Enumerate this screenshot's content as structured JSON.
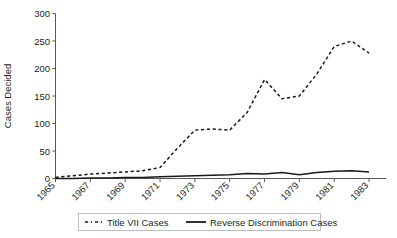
{
  "chart_data": {
    "type": "line",
    "title": "",
    "xlabel": "",
    "ylabel": "Cases Decided",
    "ylim": [
      0,
      300
    ],
    "ytick_values": [
      0,
      50,
      100,
      150,
      200,
      250,
      300
    ],
    "ytick_labels": [
      "0",
      "50",
      "100",
      "150",
      "200",
      "250",
      "300"
    ],
    "xlim": [
      1965,
      1984
    ],
    "xtick_labels": [
      "1965",
      "1967",
      "1969",
      "1971",
      "1973",
      "1975",
      "1977",
      "1979",
      "1981",
      "1983"
    ],
    "xtick_values": [
      1965,
      1967,
      1969,
      1971,
      1973,
      1975,
      1977,
      1979,
      1981,
      1983
    ],
    "x": [
      1965,
      1966,
      1967,
      1968,
      1969,
      1970,
      1971,
      1972,
      1973,
      1974,
      1975,
      1976,
      1977,
      1978,
      1979,
      1980,
      1981,
      1982,
      1983
    ],
    "grid": false,
    "legend_position": "bottom",
    "series": [
      {
        "name": "Title VII Cases",
        "style": "dashed",
        "color": "#1a1a1a",
        "values": [
          2,
          5,
          8,
          10,
          12,
          14,
          20,
          55,
          88,
          90,
          88,
          120,
          180,
          145,
          150,
          190,
          240,
          250,
          228
        ]
      },
      {
        "name": "Reverse Discrimination Cases",
        "style": "solid",
        "color": "#1a1a1a",
        "values": [
          0,
          0,
          1,
          1,
          2,
          2,
          3,
          4,
          5,
          6,
          7,
          9,
          8,
          11,
          7,
          11,
          13,
          14,
          12
        ]
      }
    ]
  },
  "legend": {
    "items": [
      {
        "label": "Title VII Cases",
        "style": "dashed"
      },
      {
        "label": "Reverse Discrimination Cases",
        "style": "solid"
      }
    ]
  }
}
